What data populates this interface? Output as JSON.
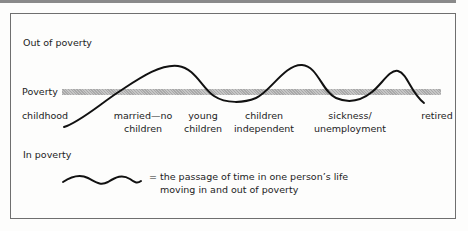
{
  "diagram": {
    "zones": {
      "out_of_poverty": "Out of poverty",
      "poverty_line": "Poverty",
      "in_poverty": "In poverty"
    },
    "stages": [
      {
        "line1": "childhood",
        "line2": ""
      },
      {
        "line1": "married—no",
        "line2": "children"
      },
      {
        "line1": "young",
        "line2": "children"
      },
      {
        "line1": "children",
        "line2": "independent"
      },
      {
        "line1": "sickness/",
        "line2": "unemployment"
      },
      {
        "line1": "retired",
        "line2": ""
      }
    ],
    "legend": {
      "equals": "=",
      "line1": "the passage of time in one person’s life",
      "line2": "moving in and out of poverty"
    },
    "colors": {
      "curve": "#111111",
      "poverty_band": "#b8b8b8",
      "frame": "#6f6f6f"
    }
  }
}
